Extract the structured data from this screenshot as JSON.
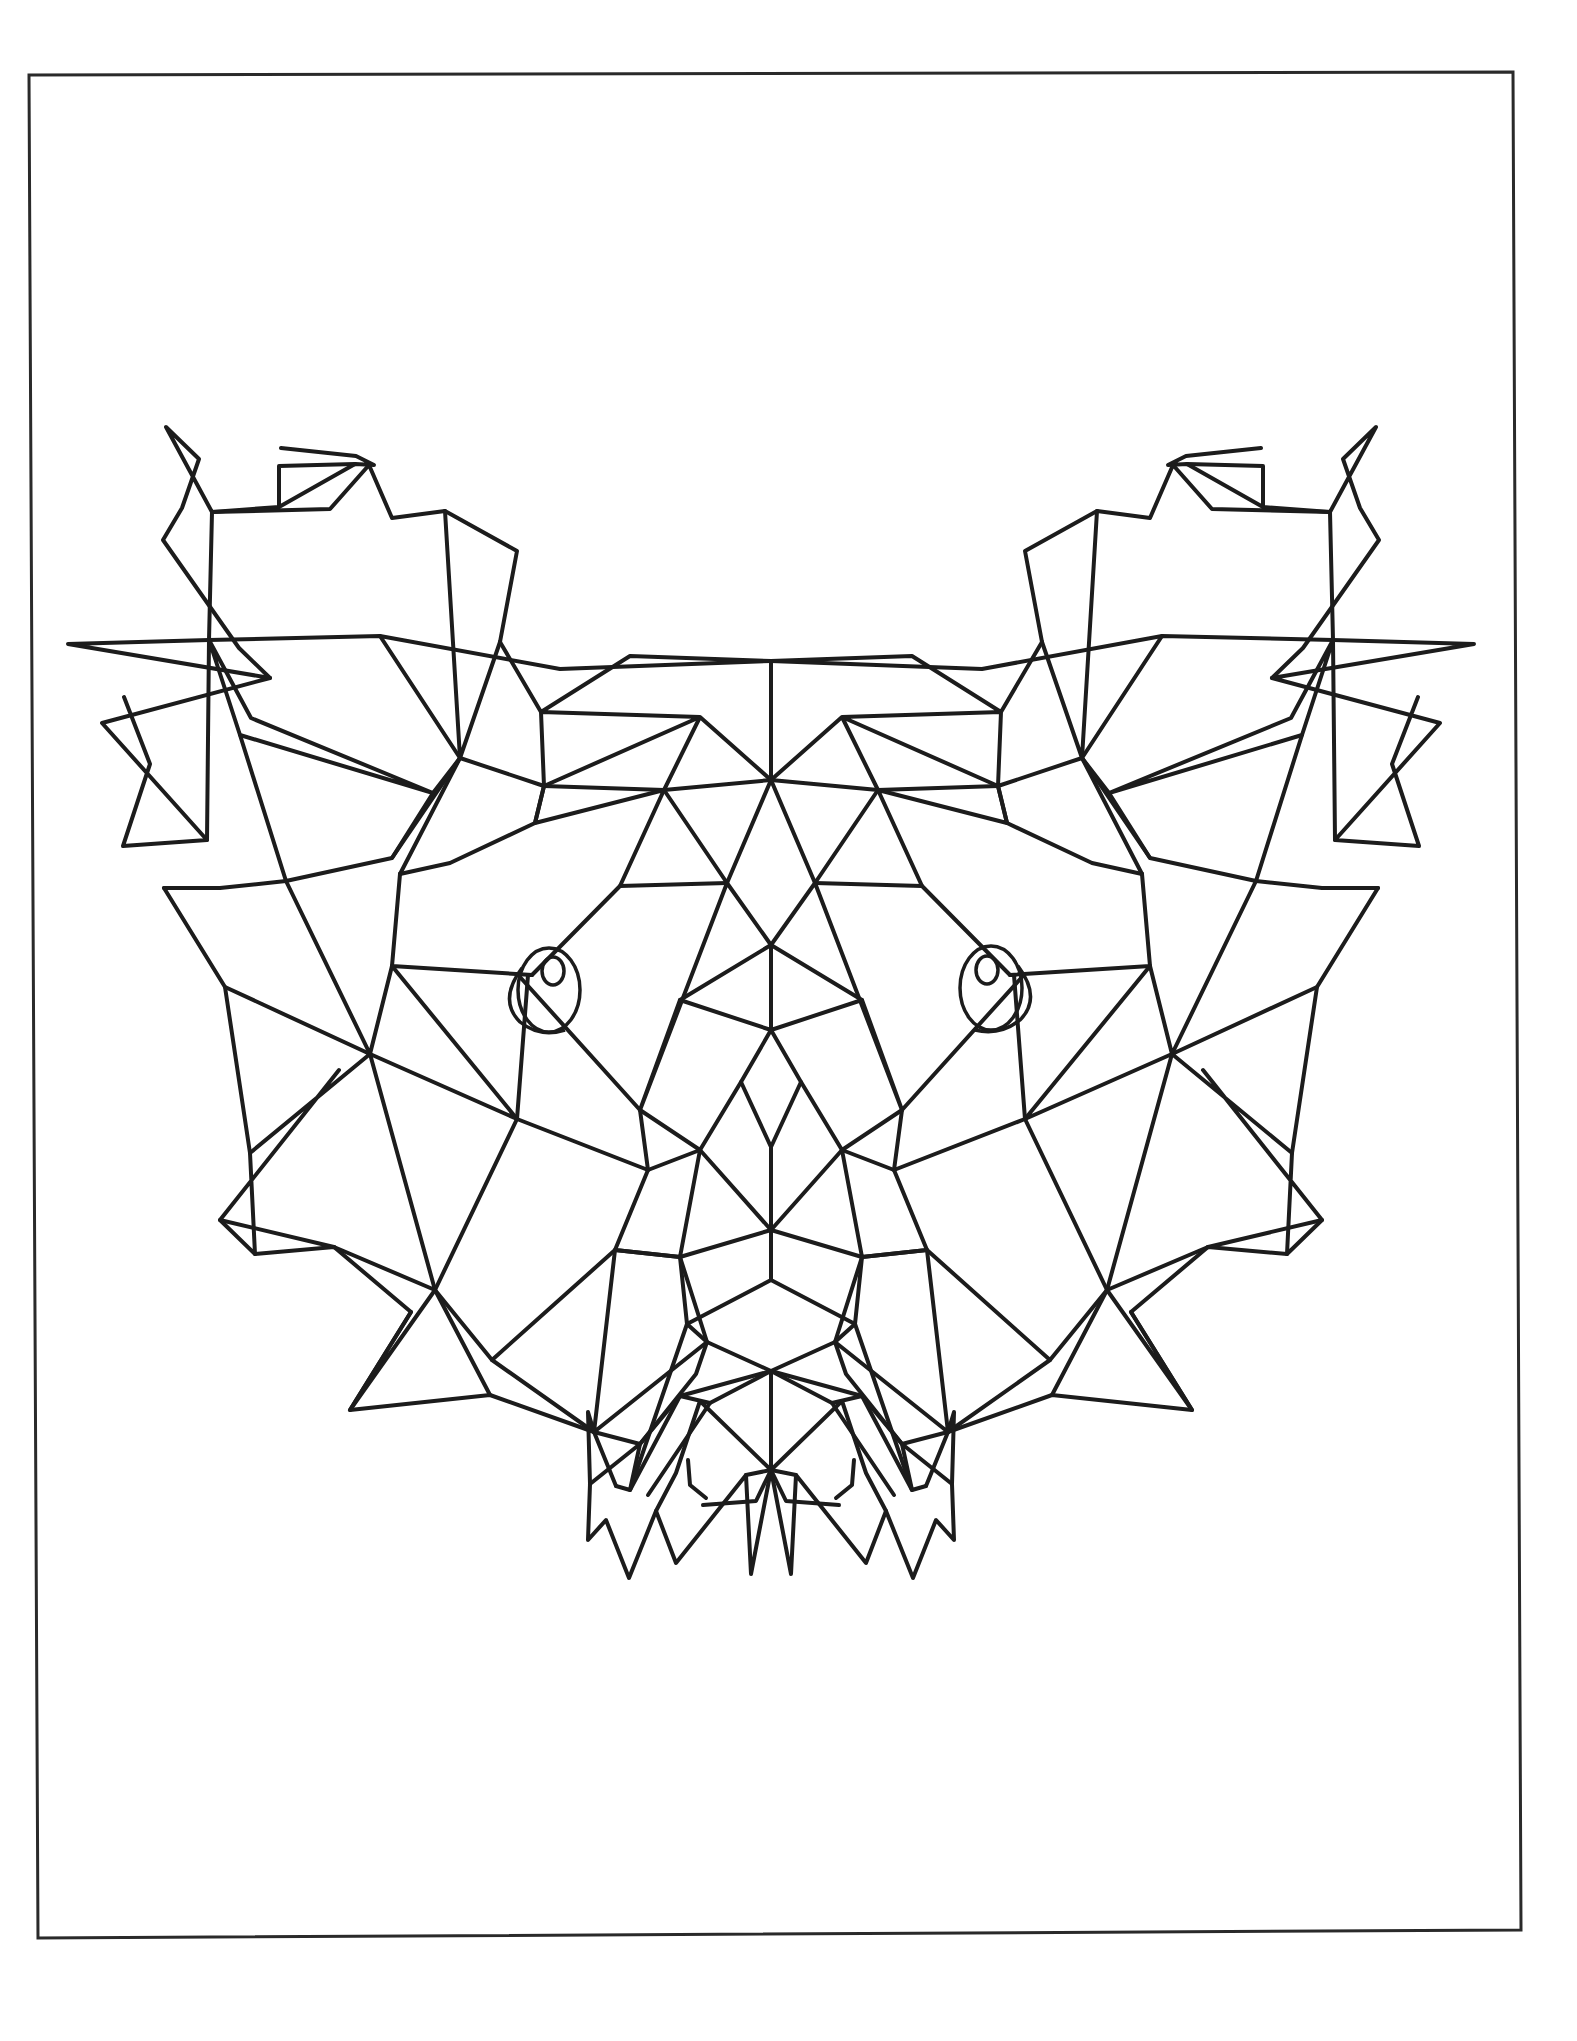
{
  "page": {
    "background": "#ffffff",
    "line_color": "#1c1c1c"
  },
  "frame": {
    "points": [
      [
        29,
        75
      ],
      [
        1513,
        72
      ],
      [
        1521,
        1930
      ],
      [
        38,
        1938
      ]
    ]
  },
  "mirror_axis_x": 771,
  "left_half_paths": [
    [
      [
        771,
        661
      ],
      [
        560,
        669
      ],
      [
        380,
        636
      ],
      [
        209,
        640
      ],
      [
        68,
        644
      ],
      [
        270,
        678
      ],
      [
        102,
        723
      ],
      [
        207,
        840
      ],
      [
        123,
        846
      ],
      [
        150,
        764
      ],
      [
        124,
        697
      ]
    ],
    [
      [
        270,
        678
      ],
      [
        239,
        648
      ],
      [
        163,
        540
      ],
      [
        182,
        508
      ],
      [
        199,
        459
      ],
      [
        166,
        427
      ],
      [
        212,
        512
      ],
      [
        279,
        507
      ],
      [
        279,
        466
      ],
      [
        355,
        464
      ],
      [
        374,
        465
      ],
      [
        356,
        456
      ],
      [
        281,
        448
      ]
    ],
    [
      [
        279,
        507
      ],
      [
        355,
        464
      ]
    ],
    [
      [
        212,
        512
      ],
      [
        330,
        509
      ],
      [
        369,
        465
      ],
      [
        392,
        518
      ],
      [
        445,
        511
      ],
      [
        517,
        551
      ],
      [
        500,
        642
      ]
    ],
    [
      [
        209,
        640
      ],
      [
        212,
        512
      ]
    ],
    [
      [
        207,
        840
      ],
      [
        209,
        640
      ],
      [
        240,
        735
      ],
      [
        433,
        793
      ],
      [
        251,
        718
      ],
      [
        209,
        640
      ]
    ],
    [
      [
        500,
        642
      ],
      [
        460,
        758
      ],
      [
        445,
        511
      ]
    ],
    [
      [
        380,
        636
      ],
      [
        460,
        758
      ],
      [
        400,
        874
      ]
    ],
    [
      [
        500,
        642
      ],
      [
        541,
        712
      ],
      [
        630,
        656
      ],
      [
        771,
        661
      ],
      [
        771,
        780
      ],
      [
        700,
        717
      ],
      [
        541,
        712
      ],
      [
        544,
        786
      ],
      [
        700,
        717
      ],
      [
        771,
        780
      ],
      [
        727,
        883
      ],
      [
        664,
        790
      ],
      [
        700,
        717
      ]
    ],
    [
      [
        544,
        786
      ],
      [
        664,
        790
      ],
      [
        771,
        780
      ]
    ],
    [
      [
        433,
        793
      ],
      [
        392,
        858
      ],
      [
        286,
        881
      ],
      [
        240,
        735
      ]
    ],
    [
      [
        392,
        858
      ],
      [
        460,
        758
      ],
      [
        544,
        786
      ],
      [
        535,
        823
      ],
      [
        664,
        790
      ],
      [
        620,
        886
      ],
      [
        727,
        883
      ]
    ],
    [
      [
        433,
        793
      ],
      [
        460,
        758
      ]
    ],
    [
      [
        400,
        874
      ],
      [
        450,
        863
      ],
      [
        535,
        823
      ],
      [
        544,
        786
      ]
    ],
    [
      [
        164,
        888
      ],
      [
        220,
        888
      ],
      [
        286,
        881
      ]
    ],
    [
      [
        400,
        874
      ],
      [
        392,
        966
      ],
      [
        532,
        975
      ],
      [
        620,
        886
      ]
    ],
    [
      [
        164,
        888
      ],
      [
        225,
        987
      ],
      [
        370,
        1054
      ],
      [
        250,
        1153
      ],
      [
        255,
        1254
      ],
      [
        220,
        1220
      ],
      [
        339,
        1070
      ]
    ],
    [
      [
        225,
        987
      ],
      [
        250,
        1153
      ]
    ],
    [
      [
        286,
        881
      ],
      [
        370,
        1054
      ],
      [
        392,
        966
      ]
    ],
    [
      [
        370,
        1054
      ],
      [
        517,
        1119
      ],
      [
        392,
        966
      ]
    ],
    [
      [
        517,
        1119
      ],
      [
        528,
        975
      ],
      [
        532,
        975
      ]
    ],
    [
      [
        520,
        977
      ],
      [
        640,
        1110
      ],
      [
        727,
        883
      ],
      [
        771,
        945
      ],
      [
        771,
        1030
      ],
      [
        680,
        1000
      ],
      [
        640,
        1110
      ]
    ],
    [
      [
        680,
        1000
      ],
      [
        771,
        945
      ]
    ],
    [
      [
        640,
        1110
      ],
      [
        700,
        1150
      ],
      [
        741,
        1082
      ],
      [
        771,
        1030
      ]
    ],
    [
      [
        741,
        1082
      ],
      [
        771,
        1147
      ],
      [
        771,
        1230
      ],
      [
        700,
        1150
      ]
    ],
    [
      [
        255,
        1254
      ],
      [
        334,
        1247
      ],
      [
        435,
        1290
      ],
      [
        370,
        1054
      ]
    ],
    [
      [
        220,
        1220
      ],
      [
        334,
        1247
      ]
    ],
    [
      [
        435,
        1290
      ],
      [
        517,
        1119
      ],
      [
        648,
        1170
      ],
      [
        640,
        1110
      ]
    ],
    [
      [
        648,
        1170
      ],
      [
        700,
        1150
      ]
    ],
    [
      [
        648,
        1170
      ],
      [
        615,
        1250
      ],
      [
        680,
        1257
      ],
      [
        700,
        1150
      ]
    ],
    [
      [
        680,
        1257
      ],
      [
        771,
        1230
      ]
    ],
    [
      [
        334,
        1247
      ],
      [
        411,
        1312
      ],
      [
        350,
        1410
      ],
      [
        435,
        1290
      ],
      [
        492,
        1360
      ],
      [
        615,
        1250
      ]
    ],
    [
      [
        492,
        1360
      ],
      [
        594,
        1432
      ],
      [
        615,
        1250
      ],
      [
        680,
        1257
      ],
      [
        707,
        1342
      ],
      [
        771,
        1371
      ],
      [
        707,
        1342
      ],
      [
        594,
        1432
      ]
    ],
    [
      [
        411,
        1312
      ],
      [
        350,
        1410
      ],
      [
        490,
        1395
      ],
      [
        594,
        1432
      ]
    ],
    [
      [
        435,
        1290
      ],
      [
        490,
        1395
      ]
    ],
    [
      [
        590,
        1484
      ],
      [
        588,
        1412
      ],
      [
        594,
        1432
      ],
      [
        640,
        1444
      ],
      [
        696,
        1374
      ],
      [
        707,
        1342
      ]
    ],
    [
      [
        590,
        1484
      ],
      [
        640,
        1444
      ],
      [
        680,
        1396
      ],
      [
        771,
        1371
      ]
    ],
    [
      [
        594,
        1432
      ],
      [
        616,
        1486
      ]
    ],
    [
      [
        640,
        1444
      ],
      [
        630,
        1490
      ],
      [
        680,
        1396
      ],
      [
        710,
        1403
      ],
      [
        771,
        1371
      ]
    ],
    [
      [
        710,
        1403
      ],
      [
        648,
        1495
      ]
    ],
    [
      [
        590,
        1484
      ],
      [
        588,
        1540
      ],
      [
        606,
        1520
      ],
      [
        629,
        1578
      ],
      [
        656,
        1511
      ],
      [
        676,
        1563
      ],
      [
        746,
        1475
      ],
      [
        751,
        1574
      ],
      [
        771,
        1470
      ],
      [
        700,
        1401
      ]
    ],
    [
      [
        746,
        1475
      ],
      [
        771,
        1470
      ],
      [
        771,
        1371
      ]
    ],
    [
      [
        680,
        1257
      ],
      [
        687,
        1324
      ],
      [
        771,
        1280
      ],
      [
        771,
        1230
      ]
    ],
    [
      [
        687,
        1324
      ],
      [
        707,
        1342
      ]
    ],
    [
      [
        616,
        1486
      ],
      [
        630,
        1490
      ],
      [
        687,
        1324
      ]
    ],
    [
      [
        656,
        1511
      ],
      [
        676,
        1473
      ],
      [
        700,
        1401
      ]
    ],
    [
      [
        688,
        1460
      ],
      [
        690,
        1485
      ],
      [
        706,
        1498
      ]
    ],
    [
      [
        771,
        1470
      ],
      [
        756,
        1501
      ],
      [
        703,
        1505
      ]
    ]
  ],
  "eyes": [
    {
      "outer": {
        "cx": 549,
        "cy": 990,
        "rx": 31,
        "ry": 42
      },
      "pupil": {
        "cx": 553,
        "cy": 971,
        "rx": 11,
        "ry": 14
      },
      "lid": "M522,968 Q498,1000 520,1022 Q540,1038 565,1030"
    },
    {
      "outer": {
        "cx": 991,
        "cy": 988,
        "rx": 31,
        "ry": 42
      },
      "pupil": {
        "cx": 987,
        "cy": 970,
        "rx": 11,
        "ry": 14
      },
      "lid": "M1018,966 Q1042,998 1020,1020 Q1000,1036 975,1030"
    }
  ]
}
